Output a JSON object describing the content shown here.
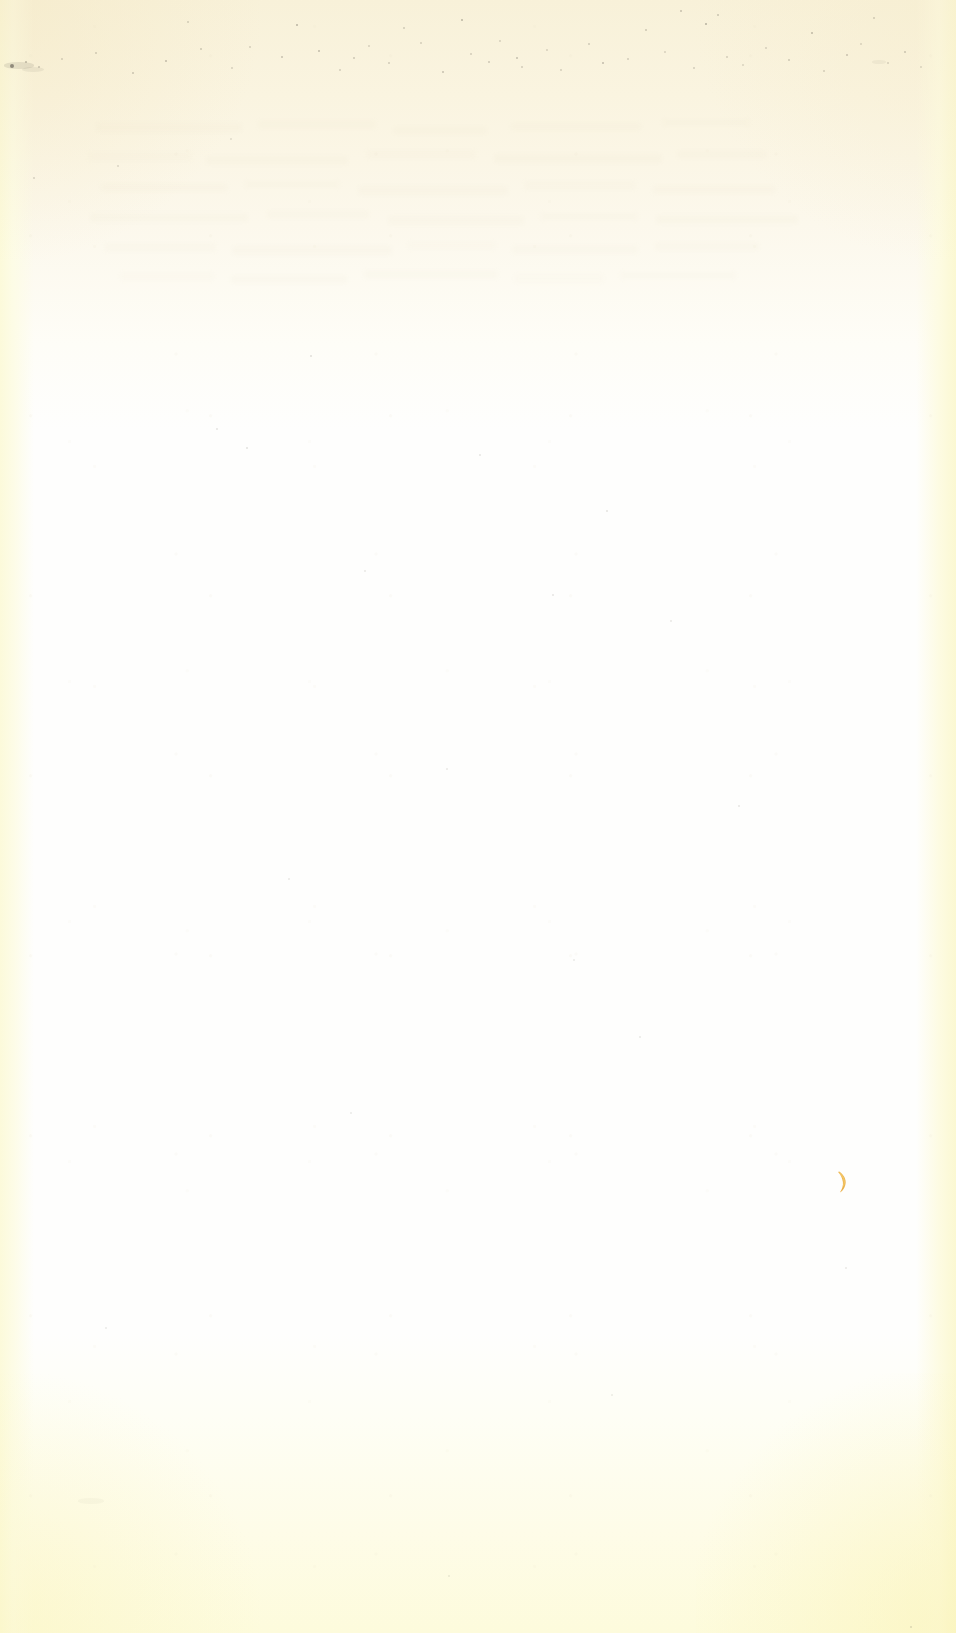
{
  "document": {
    "kind": "scanned-page",
    "description": "Blank aged paper scan",
    "width": 956,
    "height": 1633,
    "visible_text": "",
    "page_number": ""
  },
  "colors": {
    "paper_base": "#fefefd",
    "paper_cream_top": "#f8f1d9",
    "paper_yellow_bottom": "#fdfbdc",
    "edge_left_tint": "#fcfada",
    "edge_right_tint": "#fbf8d2",
    "speck": "#6f6a5e",
    "ink_mark": "#e8a93a",
    "ink_mark_highlight": "#f6cf72"
  },
  "regions": {
    "top_tint_height": 430,
    "bottom_tint_height": 300,
    "edge_left_width": 34,
    "edge_right_width": 40
  },
  "marks": {
    "ink_mark": {
      "name": "amber-crescent-mark",
      "shape": "crescent",
      "x": 843,
      "y": 1182,
      "width": 13,
      "height": 24,
      "color": "#e8a93a"
    },
    "specks": [
      {
        "x": 12,
        "y": 66,
        "r": 2.0,
        "o": 0.72
      },
      {
        "x": 26,
        "y": 62,
        "r": 1.2,
        "o": 0.42
      },
      {
        "x": 39,
        "y": 67,
        "r": 1.0,
        "o": 0.34
      },
      {
        "x": 62,
        "y": 59,
        "r": 0.9,
        "o": 0.26
      },
      {
        "x": 96,
        "y": 53,
        "r": 1.0,
        "o": 0.3
      },
      {
        "x": 133,
        "y": 73,
        "r": 1.1,
        "o": 0.33
      },
      {
        "x": 166,
        "y": 61,
        "r": 1.3,
        "o": 0.4
      },
      {
        "x": 188,
        "y": 22,
        "r": 1.0,
        "o": 0.28
      },
      {
        "x": 201,
        "y": 49,
        "r": 1.1,
        "o": 0.31
      },
      {
        "x": 232,
        "y": 68,
        "r": 0.9,
        "o": 0.25
      },
      {
        "x": 250,
        "y": 47,
        "r": 1.0,
        "o": 0.27
      },
      {
        "x": 282,
        "y": 57,
        "r": 1.2,
        "o": 0.36
      },
      {
        "x": 297,
        "y": 25,
        "r": 1.4,
        "o": 0.46
      },
      {
        "x": 319,
        "y": 51,
        "r": 1.3,
        "o": 0.41
      },
      {
        "x": 340,
        "y": 70,
        "r": 1.0,
        "o": 0.28
      },
      {
        "x": 354,
        "y": 58,
        "r": 1.1,
        "o": 0.32
      },
      {
        "x": 369,
        "y": 46,
        "r": 0.9,
        "o": 0.24
      },
      {
        "x": 389,
        "y": 63,
        "r": 1.0,
        "o": 0.29
      },
      {
        "x": 404,
        "y": 28,
        "r": 1.1,
        "o": 0.3
      },
      {
        "x": 421,
        "y": 43,
        "r": 1.0,
        "o": 0.27
      },
      {
        "x": 443,
        "y": 72,
        "r": 1.2,
        "o": 0.36
      },
      {
        "x": 462,
        "y": 20,
        "r": 1.3,
        "o": 0.44
      },
      {
        "x": 471,
        "y": 54,
        "r": 1.0,
        "o": 0.28
      },
      {
        "x": 489,
        "y": 62,
        "r": 1.1,
        "o": 0.31
      },
      {
        "x": 500,
        "y": 41,
        "r": 0.9,
        "o": 0.25
      },
      {
        "x": 517,
        "y": 58,
        "r": 1.2,
        "o": 0.38
      },
      {
        "x": 522,
        "y": 67,
        "r": 1.0,
        "o": 0.29
      },
      {
        "x": 547,
        "y": 50,
        "r": 0.9,
        "o": 0.24
      },
      {
        "x": 561,
        "y": 70,
        "r": 1.0,
        "o": 0.27
      },
      {
        "x": 589,
        "y": 44,
        "r": 1.1,
        "o": 0.3
      },
      {
        "x": 603,
        "y": 63,
        "r": 1.3,
        "o": 0.4
      },
      {
        "x": 628,
        "y": 59,
        "r": 1.0,
        "o": 0.28
      },
      {
        "x": 646,
        "y": 30,
        "r": 1.1,
        "o": 0.32
      },
      {
        "x": 665,
        "y": 52,
        "r": 0.9,
        "o": 0.24
      },
      {
        "x": 681,
        "y": 11,
        "r": 1.2,
        "o": 0.36
      },
      {
        "x": 694,
        "y": 68,
        "r": 1.0,
        "o": 0.28
      },
      {
        "x": 706,
        "y": 24,
        "r": 1.4,
        "o": 0.48
      },
      {
        "x": 718,
        "y": 15,
        "r": 1.1,
        "o": 0.33
      },
      {
        "x": 727,
        "y": 57,
        "r": 1.0,
        "o": 0.27
      },
      {
        "x": 743,
        "y": 65,
        "r": 0.9,
        "o": 0.23
      },
      {
        "x": 766,
        "y": 48,
        "r": 1.0,
        "o": 0.26
      },
      {
        "x": 789,
        "y": 60,
        "r": 1.1,
        "o": 0.31
      },
      {
        "x": 812,
        "y": 33,
        "r": 1.3,
        "o": 0.42
      },
      {
        "x": 824,
        "y": 71,
        "r": 1.0,
        "o": 0.27
      },
      {
        "x": 847,
        "y": 55,
        "r": 1.2,
        "o": 0.35
      },
      {
        "x": 861,
        "y": 44,
        "r": 0.9,
        "o": 0.23
      },
      {
        "x": 874,
        "y": 18,
        "r": 1.1,
        "o": 0.3
      },
      {
        "x": 888,
        "y": 63,
        "r": 1.0,
        "o": 0.26
      },
      {
        "x": 905,
        "y": 52,
        "r": 1.2,
        "o": 0.34
      },
      {
        "x": 921,
        "y": 67,
        "r": 0.9,
        "o": 0.22
      },
      {
        "x": 118,
        "y": 166,
        "r": 1.0,
        "o": 0.22
      },
      {
        "x": 231,
        "y": 139,
        "r": 0.9,
        "o": 0.18
      },
      {
        "x": 34,
        "y": 178,
        "r": 1.1,
        "o": 0.26
      },
      {
        "x": 311,
        "y": 356,
        "r": 1.0,
        "o": 0.2
      },
      {
        "x": 217,
        "y": 429,
        "r": 0.9,
        "o": 0.17
      },
      {
        "x": 247,
        "y": 448,
        "r": 1.0,
        "o": 0.19
      },
      {
        "x": 480,
        "y": 455,
        "r": 0.9,
        "o": 0.16
      },
      {
        "x": 607,
        "y": 511,
        "r": 1.0,
        "o": 0.18
      },
      {
        "x": 365,
        "y": 571,
        "r": 0.9,
        "o": 0.15
      },
      {
        "x": 553,
        "y": 595,
        "r": 1.0,
        "o": 0.17
      },
      {
        "x": 671,
        "y": 621,
        "r": 0.9,
        "o": 0.15
      },
      {
        "x": 447,
        "y": 769,
        "r": 0.9,
        "o": 0.14
      },
      {
        "x": 739,
        "y": 806,
        "r": 1.0,
        "o": 0.16
      },
      {
        "x": 289,
        "y": 879,
        "r": 0.9,
        "o": 0.14
      },
      {
        "x": 574,
        "y": 960,
        "r": 0.9,
        "o": 0.13
      },
      {
        "x": 640,
        "y": 1037,
        "r": 1.0,
        "o": 0.15
      },
      {
        "x": 351,
        "y": 1113,
        "r": 0.9,
        "o": 0.13
      },
      {
        "x": 846,
        "y": 1268,
        "r": 0.9,
        "o": 0.14
      },
      {
        "x": 106,
        "y": 1328,
        "r": 0.9,
        "o": 0.13
      },
      {
        "x": 612,
        "y": 1395,
        "r": 0.9,
        "o": 0.12
      },
      {
        "x": 449,
        "y": 1576,
        "r": 0.9,
        "o": 0.13
      },
      {
        "x": 911,
        "y": 1627,
        "r": 1.1,
        "o": 0.22
      }
    ],
    "smudges": [
      {
        "x": 4,
        "y": 62,
        "w": 30,
        "h": 7,
        "o": 0.38
      },
      {
        "x": 22,
        "y": 67,
        "w": 22,
        "h": 5,
        "o": 0.24
      },
      {
        "x": 872,
        "y": 60,
        "w": 14,
        "h": 4,
        "o": 0.18
      },
      {
        "x": 78,
        "y": 1498,
        "w": 26,
        "h": 6,
        "o": 0.1
      }
    ],
    "ghost_lines": [
      {
        "x": 96,
        "y": 123,
        "w": 146,
        "o": 0.22
      },
      {
        "x": 258,
        "y": 120,
        "w": 118,
        "o": 0.18
      },
      {
        "x": 392,
        "y": 126,
        "w": 96,
        "o": 0.16
      },
      {
        "x": 510,
        "y": 122,
        "w": 132,
        "o": 0.19
      },
      {
        "x": 662,
        "y": 118,
        "w": 88,
        "o": 0.15
      },
      {
        "x": 88,
        "y": 152,
        "w": 104,
        "o": 0.17
      },
      {
        "x": 206,
        "y": 156,
        "w": 142,
        "o": 0.21
      },
      {
        "x": 366,
        "y": 150,
        "w": 110,
        "o": 0.17
      },
      {
        "x": 494,
        "y": 154,
        "w": 168,
        "o": 0.23
      },
      {
        "x": 676,
        "y": 150,
        "w": 92,
        "o": 0.16
      },
      {
        "x": 100,
        "y": 183,
        "w": 128,
        "o": 0.19
      },
      {
        "x": 244,
        "y": 180,
        "w": 96,
        "o": 0.15
      },
      {
        "x": 358,
        "y": 186,
        "w": 150,
        "o": 0.22
      },
      {
        "x": 524,
        "y": 181,
        "w": 112,
        "o": 0.17
      },
      {
        "x": 652,
        "y": 185,
        "w": 124,
        "o": 0.19
      },
      {
        "x": 90,
        "y": 213,
        "w": 158,
        "o": 0.21
      },
      {
        "x": 266,
        "y": 210,
        "w": 104,
        "o": 0.16
      },
      {
        "x": 388,
        "y": 216,
        "w": 136,
        "o": 0.2
      },
      {
        "x": 540,
        "y": 212,
        "w": 98,
        "o": 0.15
      },
      {
        "x": 656,
        "y": 215,
        "w": 142,
        "o": 0.21
      },
      {
        "x": 104,
        "y": 243,
        "w": 112,
        "o": 0.17
      },
      {
        "x": 232,
        "y": 246,
        "w": 160,
        "o": 0.22
      },
      {
        "x": 408,
        "y": 241,
        "w": 88,
        "o": 0.14
      },
      {
        "x": 512,
        "y": 245,
        "w": 126,
        "o": 0.18
      },
      {
        "x": 654,
        "y": 242,
        "w": 106,
        "o": 0.16
      },
      {
        "x": 120,
        "y": 272,
        "w": 94,
        "o": 0.14
      },
      {
        "x": 230,
        "y": 275,
        "w": 118,
        "o": 0.16
      },
      {
        "x": 364,
        "y": 270,
        "w": 134,
        "o": 0.18
      },
      {
        "x": 514,
        "y": 274,
        "w": 90,
        "o": 0.13
      },
      {
        "x": 620,
        "y": 271,
        "w": 116,
        "o": 0.15
      }
    ]
  }
}
